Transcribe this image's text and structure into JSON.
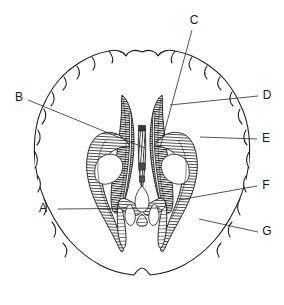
{
  "figure": {
    "background_color": "#ffffff",
    "ink_color": "#1a1a1a",
    "width": 284,
    "height": 305
  },
  "labels": [
    {
      "id": "A",
      "text": "A",
      "x": 48,
      "y": 209,
      "line_start_x": 58,
      "line_start_y": 209,
      "line_end_x": 160,
      "line_end_y": 208
    },
    {
      "id": "B",
      "text": "B",
      "x": 19,
      "y": 98,
      "line_start_x": 28,
      "line_start_y": 100,
      "line_end_x": 145,
      "line_end_y": 148
    },
    {
      "id": "C",
      "text": "C",
      "x": 194,
      "y": 21,
      "line_start_x": 192,
      "line_start_y": 30,
      "line_end_x": 160,
      "line_end_y": 148
    },
    {
      "id": "D",
      "text": "D",
      "x": 267,
      "y": 96,
      "line_start_x": 258,
      "line_start_y": 96,
      "line_end_x": 170,
      "line_end_y": 105
    },
    {
      "id": "E",
      "text": "E",
      "x": 266,
      "y": 139,
      "line_start_x": 257,
      "line_start_y": 139,
      "line_end_x": 200,
      "line_end_y": 137
    },
    {
      "id": "F",
      "text": "F",
      "x": 266,
      "y": 186,
      "line_start_x": 257,
      "line_start_y": 186,
      "line_end_x": 179,
      "line_end_y": 200
    },
    {
      "id": "G",
      "text": "G",
      "x": 267,
      "y": 232,
      "line_start_x": 258,
      "line_start_y": 232,
      "line_end_x": 199,
      "line_end_y": 219
    }
  ],
  "colors": {
    "ink": "#1a1a1a",
    "leader": "#2b2b2b",
    "hatch": "#262626",
    "paper": "#ffffff"
  }
}
